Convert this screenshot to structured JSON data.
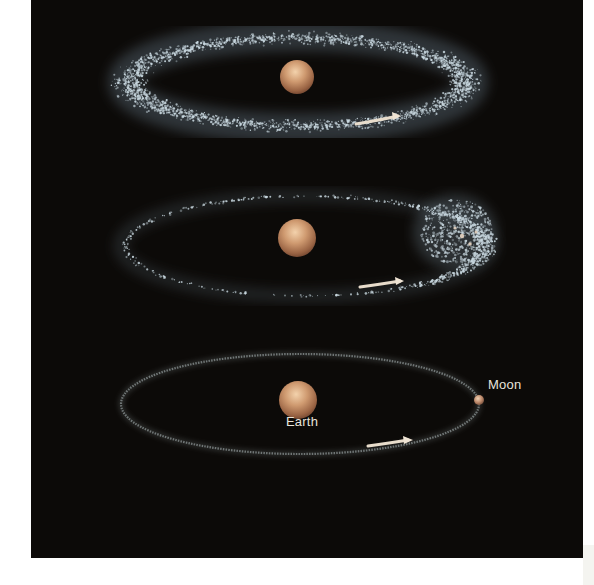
{
  "figure": {
    "background_color": "#0c0a08",
    "planet_color": "#c8926a",
    "debris_color": "#c9d8e0",
    "arrow_color": "#e8dccb",
    "stages": [
      {
        "name": "debris-disk",
        "labels": []
      },
      {
        "name": "clumping-disk",
        "labels": []
      },
      {
        "name": "moon-formed",
        "labels": [
          "Earth",
          "Moon"
        ]
      }
    ]
  },
  "labels": {
    "earth": "Earth",
    "moon": "Moon"
  }
}
